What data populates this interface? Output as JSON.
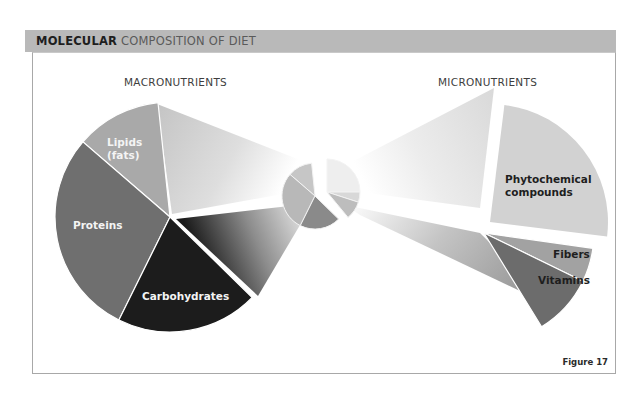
{
  "header": {
    "title_bold": "MOLECULAR",
    "title_rest": " COMPOSITION OF DIET"
  },
  "sections": {
    "macro_label": "MACRONUTRIENTS",
    "micro_label": "MICRONUTRIENTS"
  },
  "figure_label": "Figure 17",
  "colors": {
    "header_bg": "#b9b9b9",
    "lipids": "#a9a9a9",
    "proteins": "#6f6f6f",
    "carbohydrates": "#1c1c1c",
    "phytochemical": "#d2d2d2",
    "fibers": "#a2a2a2",
    "vitamins": "#6c6c6c"
  },
  "chart_data": {
    "type": "pie",
    "title": "MOLECULAR COMPOSITION OF DIET",
    "overview_pie": {
      "slices": [
        {
          "name": "Lipids (fats)",
          "share": 12
        },
        {
          "name": "Proteins",
          "share": 29
        },
        {
          "name": "Carbohydrates",
          "share": 20
        },
        {
          "name": "Phytochemical compounds",
          "share": 25
        },
        {
          "name": "Fibers",
          "share": 5
        },
        {
          "name": "Vitamins",
          "share": 9
        }
      ]
    },
    "macronutrients": {
      "label": "MACRONUTRIENTS",
      "slices": [
        {
          "name": "Lipids (fats)",
          "label_lines": [
            "Lipids",
            "(fats)"
          ],
          "share": 12
        },
        {
          "name": "Proteins",
          "label_lines": [
            "Proteins"
          ],
          "share": 29
        },
        {
          "name": "Carbohydrates",
          "label_lines": [
            "Carbohydrates"
          ],
          "share": 20
        }
      ]
    },
    "micronutrients": {
      "label": "MICRONUTRIENTS",
      "slices": [
        {
          "name": "Phytochemical compounds",
          "label_lines": [
            "Phytochemical",
            "compounds"
          ],
          "share": 25
        },
        {
          "name": "Fibers",
          "label_lines": [
            "Fibers"
          ],
          "share": 5
        },
        {
          "name": "Vitamins",
          "label_lines": [
            "Vitamins"
          ],
          "share": 9
        }
      ]
    }
  }
}
